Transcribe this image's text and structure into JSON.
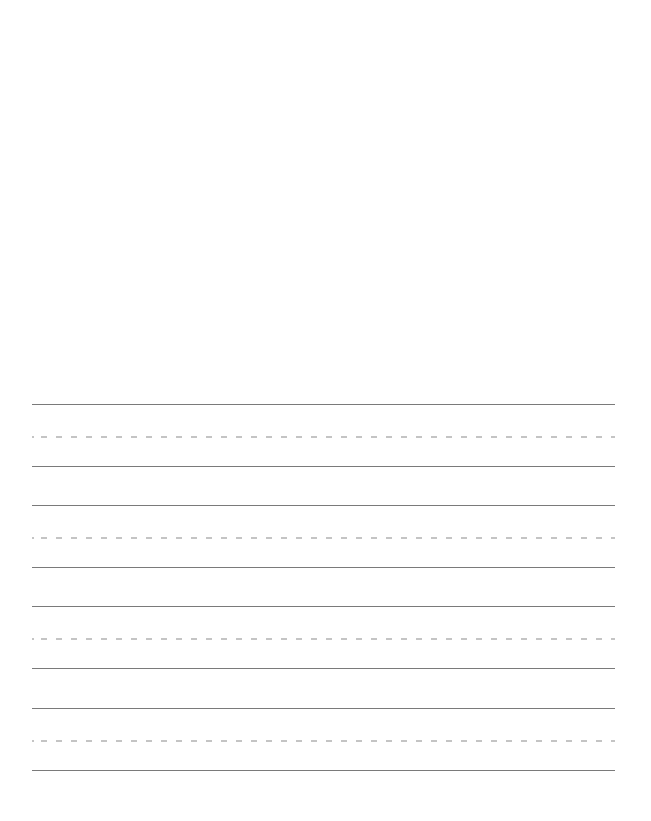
{
  "page": {
    "type": "handwriting-practice-sheet",
    "background_color": "#ffffff",
    "drawing_area": {
      "content": ""
    }
  },
  "practice_lines": {
    "solid_line_color": "#7a7a7a",
    "dashed_line_color": "#c4c4c4",
    "rows": [
      {
        "top": 404,
        "text": ""
      },
      {
        "top": 505,
        "text": ""
      },
      {
        "top": 606,
        "text": ""
      },
      {
        "top": 708,
        "text": ""
      }
    ]
  }
}
